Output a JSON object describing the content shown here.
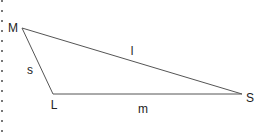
{
  "diagram": {
    "type": "triangle",
    "vertices": [
      {
        "id": "M",
        "label": "M",
        "x": 22,
        "y": 28
      },
      {
        "id": "L",
        "label": "L",
        "x": 53,
        "y": 94
      },
      {
        "id": "S",
        "label": "S",
        "x": 242,
        "y": 94
      }
    ],
    "sides": [
      {
        "id": "s",
        "label": "s",
        "from": "M",
        "to": "L"
      },
      {
        "id": "l",
        "label": "l",
        "from": "M",
        "to": "S"
      },
      {
        "id": "m",
        "label": "m",
        "from": "L",
        "to": "S"
      }
    ],
    "line_color": "#555555"
  }
}
